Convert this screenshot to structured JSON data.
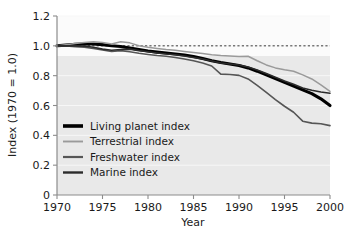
{
  "chart_data": {
    "type": "line",
    "title": "",
    "xlabel": "Year",
    "ylabel": "Index (1970 = 1.0)",
    "xlim": [
      1970,
      2000
    ],
    "ylim": [
      0,
      1.2
    ],
    "xticks": [
      "1970",
      "1975",
      "1980",
      "1985",
      "1990",
      "1995",
      "2000"
    ],
    "xtick_values": [
      1970,
      1975,
      1980,
      1985,
      1990,
      1995,
      2000
    ],
    "yticks": [
      "0",
      "0.2",
      "0.4",
      "0.6",
      "0.8",
      "1.0",
      "1.2"
    ],
    "ytick_values": [
      0,
      0.2,
      0.4,
      0.6,
      0.8,
      1.0,
      1.2
    ],
    "grid": true,
    "legend_position": "lower-left",
    "reference_line": {
      "label": "baseline 1.0",
      "y": 1.0,
      "style": "dashed",
      "x_start": 1970,
      "x_end": 2000,
      "color": "#3a3a3a"
    },
    "x": [
      1970,
      1971,
      1972,
      1973,
      1974,
      1975,
      1976,
      1977,
      1978,
      1979,
      1980,
      1981,
      1982,
      1983,
      1984,
      1985,
      1986,
      1987,
      1988,
      1989,
      1990,
      1991,
      1992,
      1993,
      1994,
      1995,
      1996,
      1997,
      1998,
      1999,
      2000
    ],
    "series": [
      {
        "name": "Living planet index",
        "color": "#000000",
        "width": 3.1,
        "values": [
          1.0,
          1.005,
          1.01,
          1.012,
          1.012,
          1.008,
          1.0,
          0.995,
          0.985,
          0.975,
          0.965,
          0.958,
          0.952,
          0.945,
          0.938,
          0.928,
          0.915,
          0.9,
          0.888,
          0.878,
          0.868,
          0.852,
          0.83,
          0.805,
          0.78,
          0.755,
          0.73,
          0.705,
          0.68,
          0.645,
          0.6
        ]
      },
      {
        "name": "Terrestrial index",
        "color": "#9a9a9a",
        "width": 1.5,
        "values": [
          1.0,
          1.008,
          1.015,
          1.022,
          1.028,
          1.022,
          1.012,
          1.028,
          1.02,
          1.0,
          0.99,
          0.982,
          0.975,
          0.97,
          0.962,
          0.955,
          0.948,
          0.94,
          0.935,
          0.932,
          0.928,
          0.93,
          0.9,
          0.872,
          0.852,
          0.84,
          0.83,
          0.805,
          0.778,
          0.738,
          0.695
        ]
      },
      {
        "name": "Freshwater index",
        "color": "#565656",
        "width": 1.6,
        "values": [
          1.0,
          1.0,
          0.995,
          0.99,
          0.982,
          0.972,
          0.962,
          0.968,
          0.96,
          0.95,
          0.942,
          0.935,
          0.93,
          0.922,
          0.912,
          0.9,
          0.885,
          0.865,
          0.81,
          0.808,
          0.802,
          0.778,
          0.735,
          0.688,
          0.64,
          0.595,
          0.555,
          0.495,
          0.482,
          0.478,
          0.465
        ]
      },
      {
        "name": "Marine index",
        "color": "#2b2b2b",
        "width": 1.6,
        "values": [
          1.0,
          1.0,
          1.0,
          0.998,
          0.99,
          0.978,
          0.97,
          0.975,
          0.978,
          0.968,
          0.96,
          0.952,
          0.945,
          0.94,
          0.932,
          0.922,
          0.912,
          0.898,
          0.885,
          0.878,
          0.872,
          0.858,
          0.838,
          0.815,
          0.79,
          0.765,
          0.742,
          0.718,
          0.702,
          0.69,
          0.682
        ]
      }
    ],
    "legend": [
      {
        "label": "Living planet index",
        "color": "#000000",
        "width": 3.6
      },
      {
        "label": "Terrestrial index",
        "color": "#9a9a9a",
        "width": 1.9
      },
      {
        "label": "Freshwater index",
        "color": "#565656",
        "width": 2.2
      },
      {
        "label": "Marine index",
        "color": "#2b2b2b",
        "width": 2.4
      }
    ]
  }
}
